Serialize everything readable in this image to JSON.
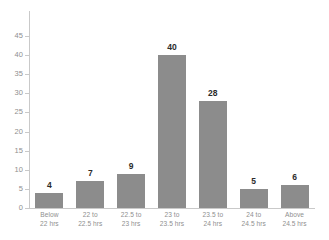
{
  "chart_data": {
    "type": "bar",
    "title": "",
    "subtitle": "",
    "xlabel": "",
    "ylabel": "",
    "categories": [
      "Below 22 hrs",
      "22 to 22.5 hrs",
      "22.5 to 23 hrs",
      "23 to 23.5 hrs",
      "23.5 to 24 hrs",
      "24 to 24.5 hrs",
      "Above 24.5 hrs"
    ],
    "category_lines": [
      [
        "Below",
        "22 hrs"
      ],
      [
        "22 to",
        "22.5 hrs"
      ],
      [
        "22.5 to",
        "23 hrs"
      ],
      [
        "23 to",
        "23.5 hrs"
      ],
      [
        "23.5 to",
        "24 hrs"
      ],
      [
        "24 to",
        "24.5 hrs"
      ],
      [
        "Above",
        "24.5 hrs"
      ]
    ],
    "values": [
      4,
      7,
      9,
      40,
      28,
      5,
      6
    ],
    "value_labels": [
      "4",
      "7",
      "9",
      "40",
      "28",
      "5",
      "6"
    ],
    "ylim": [
      0,
      45
    ],
    "ytick_step": 5,
    "yticks": [
      0,
      5,
      10,
      15,
      20,
      25,
      30,
      35,
      40,
      45
    ],
    "ytick_labels": [
      "0",
      "5",
      "10",
      "15",
      "20",
      "25",
      "30",
      "35",
      "40",
      "45"
    ],
    "grid": false,
    "legend": false,
    "legend_position": "none",
    "bar_color": "#8c8c8c",
    "axis_color": "#c9c9c9",
    "tick_label_color": "#8f8f8f",
    "value_label_color": "#2b2b2b",
    "background_color": "#ffffff"
  }
}
